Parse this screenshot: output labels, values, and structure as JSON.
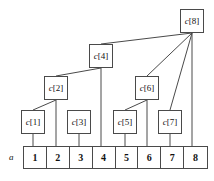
{
  "figure": {
    "width": 214,
    "height": 181,
    "background_color": "#ffffff",
    "line_color": "#4a4a4a",
    "text_color": "#111111"
  },
  "array": {
    "label": "a",
    "x": 23,
    "y": 146,
    "width": 185,
    "height": 23,
    "cells": [
      {
        "label": "1",
        "index": 1
      },
      {
        "label": "2",
        "index": 2
      },
      {
        "label": "3",
        "index": 3
      },
      {
        "label": "4",
        "index": 4
      },
      {
        "label": "5",
        "index": 5
      },
      {
        "label": "6",
        "index": 6
      },
      {
        "label": "7",
        "index": 7
      },
      {
        "label": "8",
        "index": 8
      }
    ]
  },
  "nodes": [
    {
      "id": "c1",
      "name_part": "c",
      "bracket_part": "[1]",
      "label": "c[1]",
      "x": 21,
      "y": 110,
      "w": 24,
      "h": 24
    },
    {
      "id": "c2",
      "name_part": "c",
      "bracket_part": "[2]",
      "label": "c[2]",
      "x": 44,
      "y": 76,
      "w": 24,
      "h": 24
    },
    {
      "id": "c3",
      "name_part": "c",
      "bracket_part": "[3]",
      "label": "c[3]",
      "x": 67,
      "y": 110,
      "w": 24,
      "h": 24
    },
    {
      "id": "c4",
      "name_part": "c",
      "bracket_part": "[4]",
      "label": "c[4]",
      "x": 89,
      "y": 44,
      "w": 24,
      "h": 24
    },
    {
      "id": "c5",
      "name_part": "c",
      "bracket_part": "[5]",
      "label": "c[5]",
      "x": 113,
      "y": 110,
      "w": 24,
      "h": 24
    },
    {
      "id": "c6",
      "name_part": "c",
      "bracket_part": "[6]",
      "label": "c[6]",
      "x": 135,
      "y": 76,
      "w": 24,
      "h": 24
    },
    {
      "id": "c7",
      "name_part": "c",
      "bracket_part": "[7]",
      "label": "c[7]",
      "x": 158,
      "y": 110,
      "w": 24,
      "h": 24
    },
    {
      "id": "c8",
      "name_part": "c",
      "bracket_part": "[8]",
      "label": "c[8]",
      "x": 180,
      "y": 9,
      "w": 24,
      "h": 24
    }
  ],
  "edges": [
    {
      "from": "c1",
      "to": "cell1",
      "kind": "vertical",
      "x1": 33,
      "y1": 134,
      "x2": 33,
      "y2": 146
    },
    {
      "from": "c2",
      "to": "cell2",
      "kind": "vertical",
      "x1": 56,
      "y1": 100,
      "x2": 56,
      "y2": 146
    },
    {
      "from": "c2",
      "to": "c1",
      "kind": "diagonal",
      "x1": 56,
      "y1": 100,
      "x2": 33,
      "y2": 110
    },
    {
      "from": "c3",
      "to": "cell3",
      "kind": "vertical",
      "x1": 79,
      "y1": 134,
      "x2": 79,
      "y2": 146
    },
    {
      "from": "c4",
      "to": "cell4",
      "kind": "vertical",
      "x1": 101,
      "y1": 68,
      "x2": 101,
      "y2": 146
    },
    {
      "from": "c4",
      "to": "c2",
      "kind": "diagonal",
      "x1": 101,
      "y1": 68,
      "x2": 56,
      "y2": 76
    },
    {
      "from": "c5",
      "to": "cell5",
      "kind": "vertical",
      "x1": 125,
      "y1": 134,
      "x2": 125,
      "y2": 146
    },
    {
      "from": "c6",
      "to": "cell6",
      "kind": "vertical",
      "x1": 147,
      "y1": 100,
      "x2": 147,
      "y2": 146
    },
    {
      "from": "c6",
      "to": "c5",
      "kind": "diagonal",
      "x1": 147,
      "y1": 100,
      "x2": 125,
      "y2": 110
    },
    {
      "from": "c7",
      "to": "cell7",
      "kind": "vertical",
      "x1": 170,
      "y1": 134,
      "x2": 170,
      "y2": 146
    },
    {
      "from": "c8",
      "to": "cell8",
      "kind": "vertical",
      "x1": 192,
      "y1": 33,
      "x2": 192,
      "y2": 146
    },
    {
      "from": "c8",
      "to": "c4",
      "kind": "diagonal",
      "x1": 192,
      "y1": 33,
      "x2": 101,
      "y2": 44
    },
    {
      "from": "c8",
      "to": "c6",
      "kind": "diagonal",
      "x1": 192,
      "y1": 33,
      "x2": 147,
      "y2": 76
    },
    {
      "from": "c8",
      "to": "c7",
      "kind": "diagonal",
      "x1": 192,
      "y1": 33,
      "x2": 170,
      "y2": 110
    }
  ]
}
